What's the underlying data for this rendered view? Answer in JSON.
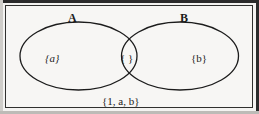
{
  "figure": {
    "type": "venn-diagram",
    "colors": {
      "background": "#f7f6f4",
      "outline": "#1c1c1c",
      "frame": "#2b2b2b",
      "text": "#1c1c1c"
    },
    "set_labels": {
      "left": "A",
      "right": "B"
    },
    "regions": {
      "left_only": "{a}",
      "intersection": "{ }",
      "right_only": "{b}"
    },
    "universe_label": "{1, a, b}"
  }
}
